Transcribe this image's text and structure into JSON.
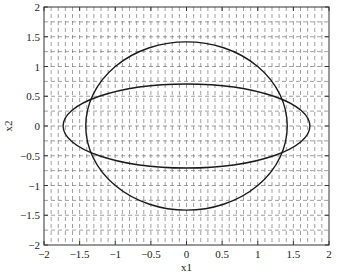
{
  "chart_data": {
    "type": "line",
    "title": "",
    "xlabel": "x1",
    "ylabel": "x2",
    "xlim": [
      -2,
      2
    ],
    "ylim": [
      -2,
      2
    ],
    "xticks": [
      -2,
      -1.5,
      -1,
      -0.5,
      0,
      0.5,
      1,
      1.5,
      2
    ],
    "yticks": [
      -2,
      -1.5,
      -1,
      -0.5,
      0,
      0.5,
      1,
      1.5,
      2
    ],
    "xtick_labels": [
      "−2",
      "−1.5",
      "−1",
      "−0.5",
      "0",
      "0.5",
      "1",
      "1.5",
      "2"
    ],
    "ytick_labels": [
      "−2",
      "−1.5",
      "−1",
      "−0.5",
      "0",
      "0.5",
      "1",
      "1.5",
      "2"
    ],
    "grid": {
      "on": true,
      "style": "dashed",
      "x_spacing": 0.1,
      "y_spacing": 0.25
    },
    "legend": null,
    "series": [
      {
        "name": "ellipse-tall",
        "kind": "ellipse",
        "center": [
          0,
          0
        ],
        "semi_axis_x": 1.414,
        "semi_axis_y": 1.414,
        "equation": "x1^2/2 + x2^2/2 = 1",
        "color": "#1a1a1a"
      },
      {
        "name": "ellipse-wide",
        "kind": "ellipse",
        "center": [
          0,
          0
        ],
        "semi_axis_x": 1.732,
        "semi_axis_y": 0.707,
        "equation": "x1^2/3 + 2*x2^2 = 1",
        "color": "#1a1a1a"
      }
    ]
  },
  "layout": {
    "plot_left": 44,
    "plot_top": 7,
    "plot_right": 329,
    "plot_bottom": 245
  }
}
